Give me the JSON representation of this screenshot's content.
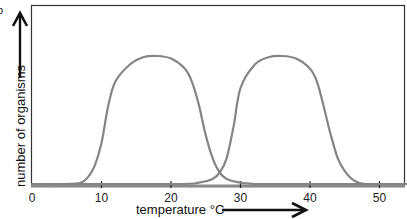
{
  "chart_data": {
    "type": "line",
    "title": "",
    "xlabel": "temperature °C",
    "ylabel": "number of organisms",
    "x_ticks": [
      0,
      10,
      20,
      30,
      40,
      50
    ],
    "x_tick_labels": [
      "0",
      "10",
      "20",
      "30",
      "40",
      "50"
    ],
    "xlim": [
      0,
      54
    ],
    "ylim": [
      0,
      1
    ],
    "y_ticks": [],
    "grid": false,
    "legend": null,
    "series": [
      {
        "name": "species A (low-temperature)",
        "x": [
          0,
          5,
          7,
          8,
          9,
          10,
          11,
          12,
          14,
          16,
          18,
          20,
          22,
          23,
          24,
          25,
          26,
          27,
          28,
          30,
          32,
          35,
          40,
          54
        ],
        "y": [
          0.0,
          0.0,
          0.01,
          0.05,
          0.14,
          0.32,
          0.62,
          0.8,
          0.93,
          0.99,
          1.0,
          0.98,
          0.9,
          0.8,
          0.62,
          0.38,
          0.2,
          0.09,
          0.04,
          0.01,
          0.0,
          0.0,
          0.0,
          0.0
        ]
      },
      {
        "name": "species B (high-temperature)",
        "x": [
          0,
          20,
          24,
          26,
          27,
          28,
          29,
          30,
          32,
          34,
          36,
          38,
          40,
          41,
          42,
          43,
          44,
          45,
          46,
          47,
          48,
          50,
          54
        ],
        "y": [
          0.0,
          0.0,
          0.01,
          0.04,
          0.09,
          0.2,
          0.45,
          0.75,
          0.93,
          0.99,
          1.0,
          0.98,
          0.9,
          0.8,
          0.6,
          0.38,
          0.2,
          0.1,
          0.04,
          0.01,
          0.0,
          0.0,
          0.0
        ]
      }
    ],
    "annotations": {
      "y_arrow": "upward arrow beside y-axis label",
      "x_arrow": "rightward arrow after x-axis label",
      "corner_mark": "b"
    }
  },
  "labels": {
    "corner_mark": "b",
    "ylabel": "number of organisms",
    "xlabel": "temperature °C"
  },
  "colors": {
    "curve": "#858585",
    "frame": "#333333",
    "baseline": "#8a8a8a",
    "text": "#111111"
  }
}
